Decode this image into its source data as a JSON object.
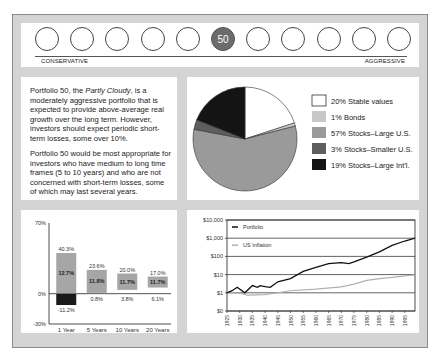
{
  "risk_scale": {
    "dials": [
      "",
      "",
      "",
      "",
      "",
      "50",
      "",
      "",
      "",
      "",
      ""
    ],
    "selected_index": 5,
    "left_label": "CONSERVATIVE",
    "right_label": "AGGRESSIVE"
  },
  "description": {
    "p1_prefix": "Portfolio 50, the ",
    "p1_italic": "Partly Cloudy",
    "p1_suffix": ", is a moderately aggressive portfolio that is expected to provide above-average real growth over the long term. However, investors should  expect periodic short-term losses, some over 10%.",
    "p2": "Portfolio 50 would be most appropriate for investors who have medium to long time frames (5 to 10 years) and who are not concerned with short-term losses, some of which may last several years."
  },
  "colors": {
    "frame": "#d4d4d4",
    "stable": "#ffffff",
    "bonds": "#c8c8c8",
    "large_us": "#9a9a9a",
    "smaller_us": "#5e5e5e",
    "large_intl": "#141414",
    "bar_range": "#a6a6a6",
    "bar_negative": "#1a1a1a",
    "portfolio_line": "#111111",
    "inflation_line": "#b0b0b0"
  },
  "chart_data": [
    {
      "type": "pie",
      "title": "",
      "labels": [
        "Stable values",
        "Bonds",
        "Stocks–Large U.S.",
        "Stocks–Smaller U.S.",
        "Stocks–Large Int'l."
      ],
      "values": [
        20,
        1,
        57,
        3,
        19
      ],
      "legend": [
        "20% Stable values",
        "1% Bonds",
        "57% Stocks–Large U.S.",
        "3% Stocks–Smaller U.S.",
        "19% Stocks–Large Int'l."
      ],
      "legend_position": "right"
    },
    {
      "type": "bar",
      "title": "",
      "categories": [
        "1 Year",
        "5 Years",
        "10 Years",
        "20 Years"
      ],
      "series": [
        {
          "name": "Best",
          "values": [
            40.3,
            23.6,
            20.0,
            17.0
          ]
        },
        {
          "name": "Average",
          "values": [
            12.7,
            11.8,
            11.7,
            11.7
          ]
        },
        {
          "name": "Worst",
          "values": [
            -11.2,
            0.8,
            3.8,
            6.1
          ]
        }
      ],
      "high_labels": [
        "40.3%",
        "23.6%",
        "20.0%",
        "17.0%"
      ],
      "avg_labels": [
        "12.7%",
        "11.8%",
        "11.7%",
        "11.7%"
      ],
      "low_labels": [
        "-11.2%",
        "0.8%",
        "3.8%",
        "6.1%"
      ],
      "y_ticks": [
        "70%",
        "0%",
        "-30%"
      ],
      "ylim": [
        -30,
        70
      ],
      "xlabel": "",
      "ylabel": ""
    },
    {
      "type": "line",
      "title": "",
      "y_scale": "log",
      "y_ticks": [
        "$10,000",
        "$1,000",
        "$100",
        "$10",
        "$1",
        "$0"
      ],
      "x_ticks": [
        "1925",
        "1930",
        "1935",
        "1940",
        "1945",
        "1950",
        "1955",
        "1960",
        "1965",
        "1970",
        "1975",
        "1980",
        "1985",
        "1990",
        "1995"
      ],
      "legend": [
        "Portfolio",
        "US Inflation"
      ],
      "series": [
        {
          "name": "Portfolio",
          "x": [
            1925,
            1927,
            1929,
            1932,
            1935,
            1937,
            1938,
            1940,
            1942,
            1945,
            1950,
            1955,
            1960,
            1965,
            1970,
            1973,
            1975,
            1980,
            1985,
            1990,
            1995,
            1999
          ],
          "values": [
            1,
            1.3,
            2,
            1,
            2.5,
            2,
            2.5,
            2.2,
            2,
            4,
            6,
            15,
            25,
            40,
            45,
            40,
            50,
            90,
            180,
            400,
            700,
            1000
          ]
        },
        {
          "name": "US Inflation",
          "x": [
            1925,
            1930,
            1933,
            1940,
            1945,
            1950,
            1960,
            1970,
            1975,
            1980,
            1985,
            1990,
            1995,
            1999
          ],
          "values": [
            1,
            0.95,
            0.75,
            0.8,
            1,
            1.3,
            1.6,
            2.1,
            3,
            4.8,
            6,
            7,
            8.5,
            9.5
          ]
        }
      ],
      "grid": true,
      "legend_position": "top-left inside"
    }
  ]
}
